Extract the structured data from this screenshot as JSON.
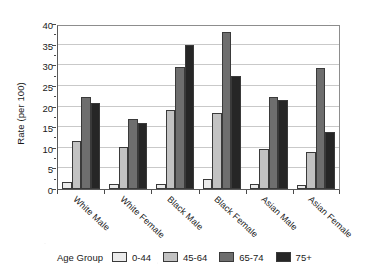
{
  "chart_data": {
    "type": "bar",
    "title": "",
    "xlabel": "",
    "ylabel": "Rate (per 100)",
    "ylim": [
      0,
      40
    ],
    "ytick_step": 5,
    "yticks": [
      0,
      5,
      10,
      15,
      20,
      25,
      30,
      35,
      40
    ],
    "ytick_labels": [
      "0",
      "5",
      "10",
      "15",
      "20",
      "25",
      "30",
      "35",
      "40"
    ],
    "grid": "horizontal",
    "legend_position": "bottom",
    "legend_title": "Age Group",
    "categories": [
      "White Male",
      "White Female",
      "Black Male",
      "Black Female",
      "Asian Male",
      "Asian Female"
    ],
    "series": [
      {
        "name": "0-44",
        "color": "#ebebeb",
        "values": [
          1.6,
          1.3,
          1.2,
          2.5,
          1.1,
          1.0
        ]
      },
      {
        "name": "45-64",
        "color": "#c2c2c2",
        "values": [
          11.7,
          10.3,
          19.2,
          18.4,
          9.6,
          8.9
        ]
      },
      {
        "name": "65-74",
        "color": "#6e6e6e",
        "values": [
          22.2,
          17.0,
          29.5,
          38.0,
          22.3,
          29.3
        ]
      },
      {
        "name": "75+",
        "color": "#262626",
        "values": [
          20.8,
          16.1,
          35.0,
          27.5,
          21.7,
          13.8
        ]
      }
    ]
  },
  "axes": {
    "y_title": "Rate (per 100)"
  },
  "legend": {
    "title": "Age Group",
    "items": [
      {
        "label": "0-44"
      },
      {
        "label": "45-64"
      },
      {
        "label": "65-74"
      },
      {
        "label": "75+"
      }
    ]
  }
}
